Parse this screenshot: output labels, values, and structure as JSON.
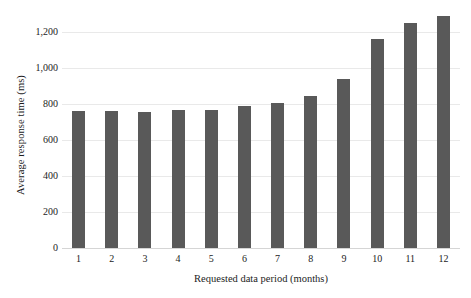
{
  "chart_data": {
    "type": "bar",
    "title": "",
    "xlabel": "Requested data period (months)",
    "ylabel": "Average response time (ms)",
    "categories": [
      "1",
      "2",
      "3",
      "4",
      "5",
      "6",
      "7",
      "8",
      "9",
      "10",
      "11",
      "12"
    ],
    "values": [
      763,
      760,
      757,
      766,
      766,
      790,
      805,
      842,
      940,
      1160,
      1250,
      1288
    ],
    "series": [
      {
        "name": "Average response time (ms)",
        "values": [
          763,
          760,
          757,
          766,
          766,
          790,
          805,
          842,
          940,
          1160,
          1250,
          1288
        ]
      }
    ],
    "ylim": [
      0,
      1300
    ],
    "y_ticks": [
      0,
      200,
      400,
      600,
      800,
      1000,
      1200
    ],
    "y_tick_labels": [
      "0",
      "200",
      "400",
      "600",
      "800",
      "1,000",
      "1,200"
    ],
    "grid": true,
    "legend": false,
    "legend_position": "none",
    "bar_color": "#595959",
    "gridline_color": "#e9e9e9",
    "background_color": "#ffffff"
  }
}
